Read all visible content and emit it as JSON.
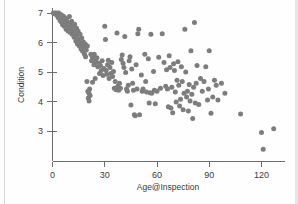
{
  "chart_data": {
    "type": "scatter",
    "title": "",
    "xlabel": "Age@Inspection",
    "ylabel": "Condition",
    "xlim": [
      -3,
      133
    ],
    "ylim": [
      2.3,
      7.25
    ],
    "xticks": [
      0,
      30,
      60,
      90,
      120
    ],
    "xtick_labels": [
      "0",
      "30",
      "60",
      "90",
      "120"
    ],
    "yticks": [
      3,
      4,
      5,
      6,
      7
    ],
    "ytick_labels": [
      "3",
      "4",
      "5",
      "6",
      "7"
    ],
    "grid": false,
    "legend": null,
    "marker": {
      "shape": "circle",
      "color": "#7d7d7d",
      "size_px": 5
    },
    "axis_color": "#6d6d6d",
    "n_points": 196,
    "points": [
      [
        0.5,
        7.0
      ],
      [
        1.0,
        6.98
      ],
      [
        1.5,
        7.0
      ],
      [
        2.0,
        6.95
      ],
      [
        2.3,
        7.0
      ],
      [
        2.8,
        6.92
      ],
      [
        3.2,
        6.85
      ],
      [
        3.5,
        7.0
      ],
      [
        4.0,
        6.88
      ],
      [
        4.3,
        6.75
      ],
      [
        4.8,
        6.95
      ],
      [
        5.0,
        6.7
      ],
      [
        5.4,
        6.82
      ],
      [
        5.8,
        6.6
      ],
      [
        6.1,
        6.9
      ],
      [
        6.5,
        6.72
      ],
      [
        6.8,
        6.55
      ],
      [
        7.0,
        6.85
      ],
      [
        7.4,
        6.62
      ],
      [
        7.8,
        6.45
      ],
      [
        8.0,
        6.78
      ],
      [
        8.4,
        6.58
      ],
      [
        8.8,
        6.4
      ],
      [
        9.0,
        6.68
      ],
      [
        9.3,
        6.52
      ],
      [
        9.7,
        6.88
      ],
      [
        10.0,
        6.35
      ],
      [
        10.3,
        6.6
      ],
      [
        10.7,
        6.45
      ],
      [
        11.0,
        6.72
      ],
      [
        11.3,
        6.28
      ],
      [
        11.7,
        6.55
      ],
      [
        12.0,
        6.4
      ],
      [
        12.4,
        6.18
      ],
      [
        12.7,
        6.62
      ],
      [
        13.0,
        6.32
      ],
      [
        13.4,
        6.05
      ],
      [
        13.8,
        6.48
      ],
      [
        14.0,
        6.22
      ],
      [
        14.3,
        5.95
      ],
      [
        14.7,
        6.38
      ],
      [
        15.0,
        6.1
      ],
      [
        15.4,
        5.88
      ],
      [
        15.8,
        6.28
      ],
      [
        16.0,
        6.0
      ],
      [
        16.4,
        5.78
      ],
      [
        16.8,
        6.15
      ],
      [
        17.0,
        5.92
      ],
      [
        17.3,
        5.7
      ],
      [
        17.7,
        6.02
      ],
      [
        18.0,
        5.85
      ],
      [
        18.4,
        5.6
      ],
      [
        18.8,
        5.95
      ],
      [
        19.0,
        5.52
      ],
      [
        19.4,
        5.75
      ],
      [
        19.8,
        4.68
      ],
      [
        20.0,
        5.88
      ],
      [
        20.3,
        4.35
      ],
      [
        20.6,
        4.12
      ],
      [
        20.9,
        4.28
      ],
      [
        21.0,
        4.02
      ],
      [
        21.3,
        4.42
      ],
      [
        21.6,
        4.2
      ],
      [
        22.0,
        5.6
      ],
      [
        22.4,
        5.38
      ],
      [
        22.8,
        5.52
      ],
      [
        23.0,
        4.65
      ],
      [
        23.4,
        5.45
      ],
      [
        23.8,
        5.25
      ],
      [
        24.0,
        5.6
      ],
      [
        24.5,
        4.78
      ],
      [
        25.0,
        5.35
      ],
      [
        25.5,
        5.48
      ],
      [
        26.0,
        5.18
      ],
      [
        26.5,
        5.3
      ],
      [
        27.0,
        4.95
      ],
      [
        27.5,
        5.22
      ],
      [
        28.0,
        5.05
      ],
      [
        28.5,
        5.38
      ],
      [
        29.0,
        4.88
      ],
      [
        29.5,
        5.12
      ],
      [
        30.0,
        6.55
      ],
      [
        30.4,
        6.1
      ],
      [
        30.8,
        5.05
      ],
      [
        31.2,
        4.92
      ],
      [
        31.6,
        5.25
      ],
      [
        32.0,
        5.4
      ],
      [
        32.5,
        4.78
      ],
      [
        33.0,
        5.15
      ],
      [
        33.5,
        4.95
      ],
      [
        34.0,
        5.32
      ],
      [
        34.5,
        4.85
      ],
      [
        35.0,
        5.02
      ],
      [
        35.5,
        4.45
      ],
      [
        36.0,
        4.68
      ],
      [
        36.5,
        4.4
      ],
      [
        37.0,
        6.32
      ],
      [
        37.5,
        4.52
      ],
      [
        38.0,
        4.38
      ],
      [
        38.5,
        4.62
      ],
      [
        39.0,
        4.45
      ],
      [
        39.5,
        5.42
      ],
      [
        40.0,
        5.58
      ],
      [
        40.5,
        5.3
      ],
      [
        41.0,
        5.15
      ],
      [
        41.5,
        6.2
      ],
      [
        42.0,
        4.98
      ],
      [
        42.5,
        4.42
      ],
      [
        43.0,
        4.35
      ],
      [
        43.5,
        4.55
      ],
      [
        44.0,
        5.38
      ],
      [
        44.5,
        5.52
      ],
      [
        45.0,
        3.88
      ],
      [
        45.5,
        5.1
      ],
      [
        46.0,
        4.62
      ],
      [
        46.5,
        4.38
      ],
      [
        47.0,
        3.55
      ],
      [
        47.5,
        3.52
      ],
      [
        48.0,
        5.25
      ],
      [
        48.5,
        4.42
      ],
      [
        49.0,
        6.3
      ],
      [
        49.5,
        6.45
      ],
      [
        50.0,
        3.55
      ],
      [
        51.0,
        4.9
      ],
      [
        51.5,
        4.35
      ],
      [
        52.0,
        4.42
      ],
      [
        53.0,
        5.6
      ],
      [
        53.5,
        4.68
      ],
      [
        54.0,
        4.32
      ],
      [
        55.0,
        5.45
      ],
      [
        55.5,
        3.95
      ],
      [
        56.0,
        4.3
      ],
      [
        56.5,
        6.28
      ],
      [
        57.0,
        4.28
      ],
      [
        58.0,
        5.02
      ],
      [
        58.5,
        4.38
      ],
      [
        59.0,
        3.92
      ],
      [
        60.0,
        4.35
      ],
      [
        61.0,
        5.5
      ],
      [
        62.0,
        4.45
      ],
      [
        63.0,
        6.3
      ],
      [
        64.0,
        5.32
      ],
      [
        65.0,
        4.52
      ],
      [
        65.5,
        5.08
      ],
      [
        66.0,
        4.42
      ],
      [
        66.5,
        3.82
      ],
      [
        67.0,
        5.55
      ],
      [
        67.5,
        5.15
      ],
      [
        68.0,
        3.78
      ],
      [
        68.5,
        4.48
      ],
      [
        69.0,
        3.62
      ],
      [
        69.5,
        5.28
      ],
      [
        70.0,
        5.05
      ],
      [
        70.5,
        4.32
      ],
      [
        71.0,
        3.98
      ],
      [
        71.5,
        4.72
      ],
      [
        72.0,
        5.35
      ],
      [
        72.5,
        4.55
      ],
      [
        73.0,
        3.85
      ],
      [
        73.5,
        4.08
      ],
      [
        74.0,
        5.18
      ],
      [
        74.5,
        4.68
      ],
      [
        75.0,
        3.72
      ],
      [
        75.5,
        4.28
      ],
      [
        76.0,
        6.45
      ],
      [
        76.5,
        5.0
      ],
      [
        77.0,
        4.15
      ],
      [
        77.5,
        4.35
      ],
      [
        78.0,
        3.68
      ],
      [
        78.5,
        4.58
      ],
      [
        79.0,
        4.02
      ],
      [
        79.5,
        5.72
      ],
      [
        80.0,
        4.25
      ],
      [
        80.5,
        3.42
      ],
      [
        81.0,
        4.48
      ],
      [
        81.5,
        6.68
      ],
      [
        82.0,
        3.95
      ],
      [
        82.5,
        4.62
      ],
      [
        83.0,
        5.22
      ],
      [
        84.0,
        3.9
      ],
      [
        85.0,
        4.78
      ],
      [
        86.0,
        4.35
      ],
      [
        87.0,
        4.68
      ],
      [
        88.0,
        5.18
      ],
      [
        89.0,
        4.05
      ],
      [
        89.5,
        4.42
      ],
      [
        90.0,
        5.72
      ],
      [
        91.0,
        3.6
      ],
      [
        92.0,
        4.15
      ],
      [
        93.0,
        4.72
      ],
      [
        94.0,
        4.55
      ],
      [
        95.0,
        4.05
      ],
      [
        97.0,
        4.62
      ],
      [
        99.0,
        4.28
      ],
      [
        108.0,
        3.58
      ],
      [
        120.0,
        2.95
      ],
      [
        121.0,
        2.38
      ],
      [
        127.0,
        3.08
      ]
    ]
  }
}
